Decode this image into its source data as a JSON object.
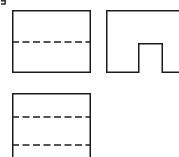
{
  "figure": {
    "background_color": "#ffffff",
    "line_color": "#1c1c1c",
    "hidden_line_color": "#1c1c1c",
    "canvas": {
      "width": 179,
      "height": 157
    },
    "label_fragment": "]"
  },
  "views": {
    "front": {
      "name": "front-view",
      "shape": "rectangle",
      "x": 12,
      "y": 10,
      "width": 79,
      "height": 63,
      "hidden_lines": [
        {
          "name": "front-hidden-line-1",
          "y": 42,
          "x1": 12,
          "x2": 91
        }
      ]
    },
    "side": {
      "name": "side-view",
      "shape": "notched-rectangle",
      "x": 106,
      "y": 10,
      "width": 73,
      "height": 63,
      "notch": {
        "name": "side-view-notch",
        "left_x": 138,
        "right_x": 163,
        "top_y": 43,
        "bottom_y": 73,
        "width": 25,
        "depth": 30
      },
      "outline_points": "106,10 179,10 179,73 163,73 163,43 138,43 138,73 106,73 106,10",
      "clipped_right_edge": true
    },
    "top": {
      "name": "top-view",
      "shape": "rectangle",
      "x": 12,
      "y": 93,
      "width": 79,
      "height": 68,
      "clipped_bottom_edge": true,
      "hidden_lines": [
        {
          "name": "top-hidden-line-1",
          "y": 117,
          "x1": 12,
          "x2": 91
        },
        {
          "name": "top-hidden-line-2",
          "y": 145,
          "x1": 12,
          "x2": 91
        }
      ]
    }
  },
  "line_style": {
    "solid_width": 1.5,
    "hidden_width": 1.5,
    "dash_length": 7,
    "dash_gap": 3.5
  }
}
